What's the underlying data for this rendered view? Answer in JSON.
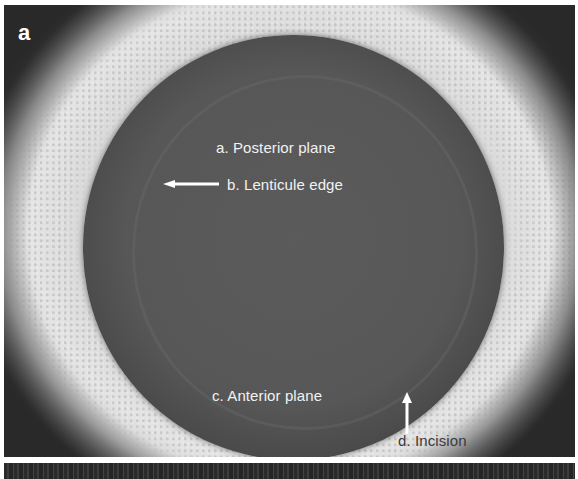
{
  "figure": {
    "panel_letter": "a",
    "labels": {
      "posterior_plane": "a. Posterior plane",
      "lenticule_edge": "b. Lenticule edge",
      "anterior_plane": "c. Anterior plane",
      "incision": "d. Incision"
    },
    "annotations": [
      {
        "id": "lenticule-edge-arrow",
        "direction": "left",
        "color": "#ffffff"
      },
      {
        "id": "incision-arrow",
        "direction": "up",
        "color": "#ffffff"
      }
    ],
    "colors": {
      "disc": "#555555",
      "surround": "#d4d4d4",
      "label_light": "#f2f2f2",
      "label_dark": "#3a3a3a",
      "panel_letter": "#ffffff"
    }
  }
}
